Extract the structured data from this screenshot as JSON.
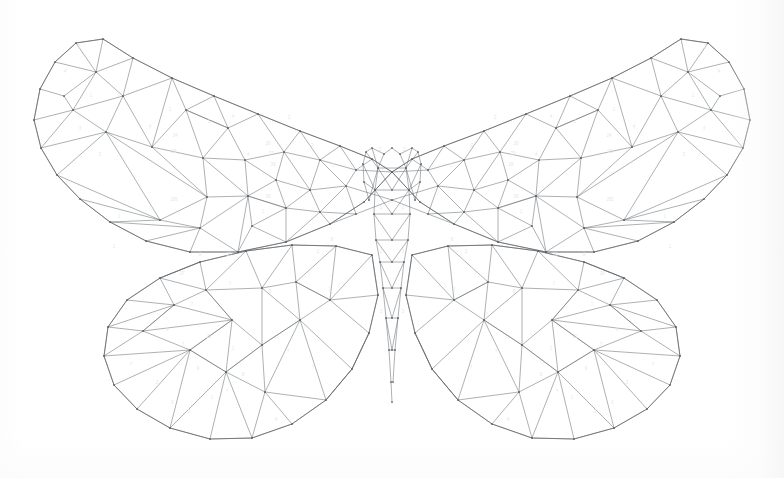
{
  "document": {
    "title": "Color By Number Butterfly",
    "subject": "butterfly",
    "style": "low-poly triangulated color-by-number line art",
    "medium": "line drawing on white paper",
    "symmetry": "bilateral / mirrored about vertical center axis",
    "background_color": "#ffffff",
    "line_color": "#6b6f73",
    "outline_color": "#5c6064",
    "number_color": "#e6e6e6",
    "vertex_dot_color": "#4f5356",
    "canvas": {
      "width": 784,
      "height": 478
    },
    "figure_bounds": {
      "left": 33,
      "top": 31,
      "right": 751,
      "bottom": 441
    },
    "mirror_axis_x": 392
  },
  "legend": {
    "palette_numbers": [
      "1",
      "2",
      "3",
      "4",
      "6",
      "7",
      "8",
      "9",
      "20",
      "22",
      "23",
      "24",
      "26",
      "27",
      "28",
      "29"
    ],
    "note": "Each triangular cell carries a faint palette index numeral."
  },
  "anatomy": {
    "parts": [
      {
        "name": "upper-left-wing",
        "label": "Upper Left Wing"
      },
      {
        "name": "upper-right-wing",
        "label": "Upper Right Wing"
      },
      {
        "name": "lower-left-wing",
        "label": "Lower Left Wing"
      },
      {
        "name": "lower-right-wing",
        "label": "Lower Right Wing"
      },
      {
        "name": "body-thorax",
        "label": "Thorax"
      },
      {
        "name": "body-abdomen",
        "label": "Abdomen"
      },
      {
        "name": "antennae",
        "label": "Antennae"
      }
    ]
  },
  "geometry": {
    "upper_left_wing_outline": "M 392 172 L 372 159 L 340 146 L 300 131 L 258 114 L 214 96 L 172 78 L 133 58 L 103 39 L 76 43 L 55 62 L 40 89 L 34 120 L 41 148 L 57 175 L 80 199 L 110 222 L 146 241 L 190 252 L 238 252 L 286 242 L 330 224 L 364 202 Z",
    "lower_left_wing_outline": "M 372 255 L 336 246 L 292 245 L 246 251 L 200 262 L 160 278 L 127 300 L 108 327 L 104 356 L 114 385 L 137 409 L 170 428 L 210 439 L 252 438 L 292 424 L 326 400 L 352 369 L 369 333 L 378 295 Z",
    "body_outline": "M 392 148 L 384 154 L 378 168 L 375 190 L 374 214 L 376 240 L 380 262 L 383 288 L 386 318 L 389 350 L 391 382 L 392 402",
    "antenna_left": "M 384 154 L 372 148 L 366 152 L 363 164 L 364 182 L 369 200",
    "antenna_right": "M 400 154 L 412 148 L 418 152 L 421 164 L 420 182 L 415 200"
  },
  "edges": {
    "upper_left": [
      "103,39 76,43",
      "76,43 55,62",
      "55,62 40,89",
      "40,89 34,120",
      "34,120 41,148",
      "41,148 57,175",
      "57,175 80,199",
      "80,199 110,222",
      "110,222 146,241",
      "146,241 190,252",
      "190,252 238,252",
      "238,252 286,242",
      "286,242 330,224",
      "330,224 364,202",
      "364,202 392,172",
      "103,39 133,58",
      "133,58 172,78",
      "172,78 214,96",
      "214,96 258,114",
      "258,114 300,131",
      "300,131 340,146",
      "340,146 372,159",
      "372,159 392,172",
      "103,39 96,72",
      "96,72 76,43",
      "96,72 55,62",
      "96,72 64,96",
      "64,96 40,89",
      "96,72 73,110",
      "73,110 64,96",
      "73,110 34,120",
      "73,110 41,148",
      "96,72 133,58",
      "96,72 123,96",
      "123,96 133,58",
      "123,96 172,78",
      "123,96 73,110",
      "123,96 106,132",
      "106,132 73,110",
      "106,132 41,148",
      "106,132 57,175",
      "106,132 152,147",
      "152,147 123,96",
      "152,147 172,78",
      "172,78 186,110",
      "186,110 152,147",
      "186,110 214,96",
      "186,110 228,128",
      "228,128 214,96",
      "228,128 258,114",
      "228,128 186,110",
      "228,128 203,158",
      "203,158 186,110",
      "203,158 152,147",
      "203,158 245,160",
      "245,160 228,128",
      "245,160 284,152",
      "284,152 258,114",
      "284,152 300,131",
      "284,152 320,160",
      "320,160 300,131",
      "320,160 340,146",
      "320,160 356,170",
      "356,170 340,146",
      "356,170 372,159",
      "356,170 392,172",
      "320,160 346,186",
      "346,186 356,170",
      "346,186 392,200",
      "346,186 310,190",
      "310,190 320,160",
      "310,190 284,152",
      "310,190 276,180",
      "276,180 284,152",
      "276,180 245,160",
      "276,180 248,196",
      "248,196 245,160",
      "248,196 203,158",
      "248,196 207,197",
      "207,197 203,158",
      "207,197 152,147",
      "207,197 106,132",
      "207,197 160,220",
      "160,220 106,132",
      "160,220 57,175",
      "160,220 80,199",
      "160,220 110,222",
      "160,220 200,228",
      "200,228 207,197",
      "200,228 248,196",
      "200,228 238,252",
      "200,228 190,252",
      "200,228 146,241",
      "200,228 110,222",
      "248,196 286,208",
      "286,208 276,180",
      "286,208 310,190",
      "286,208 320,212",
      "320,212 310,190",
      "320,212 346,186",
      "320,212 356,214",
      "356,214 346,186",
      "356,214 392,200",
      "356,214 330,224",
      "330,224 320,212",
      "320,212 286,242",
      "286,242 286,208",
      "286,208 248,196",
      "248,196 238,252",
      "286,208 252,226",
      "252,226 248,196",
      "252,226 238,252",
      "252,226 286,242"
    ],
    "lower_left": [
      "372,255 336,246",
      "336,246 292,245",
      "292,245 246,251",
      "246,251 200,262",
      "200,262 160,278",
      "160,278 127,300",
      "127,300 108,327",
      "108,327 104,356",
      "104,356 114,385",
      "114,385 137,409",
      "137,409 170,428",
      "170,428 210,439",
      "210,439 252,438",
      "252,438 292,424",
      "292,424 326,400",
      "326,400 352,369",
      "352,369 369,333",
      "369,333 378,295",
      "378,295 372,255",
      "160,278 174,305",
      "174,305 127,300",
      "174,305 108,327",
      "174,305 143,331",
      "143,331 108,327",
      "143,331 104,356",
      "143,331 174,305",
      "160,278 200,262",
      "160,278 206,290",
      "206,290 200,262",
      "206,290 246,251",
      "206,290 174,305",
      "206,290 232,320",
      "232,320 174,305",
      "232,320 143,331",
      "232,320 206,290",
      "232,320 190,350",
      "190,350 143,331",
      "190,350 104,356",
      "190,350 114,385",
      "190,350 232,320",
      "246,251 262,288",
      "262,288 206,290",
      "262,288 292,245",
      "262,288 296,282",
      "296,282 292,245",
      "296,282 336,246",
      "296,282 330,300",
      "330,300 336,246",
      "330,300 372,255",
      "330,300 378,295",
      "330,300 369,333",
      "330,300 296,282",
      "296,282 300,320",
      "300,320 262,288",
      "300,320 330,300",
      "300,320 352,369",
      "300,320 262,345",
      "262,345 232,320",
      "262,345 262,288",
      "262,345 300,320",
      "262,345 226,372",
      "226,372 190,350",
      "226,372 232,320",
      "226,372 262,345",
      "226,372 265,392",
      "265,392 262,345",
      "265,392 300,320",
      "265,392 326,400",
      "265,392 292,424",
      "265,392 252,438",
      "226,372 210,439",
      "226,372 252,438",
      "226,372 170,428",
      "226,372 190,350",
      "190,350 137,409",
      "190,350 170,428",
      "300,320 326,400",
      "352,369 326,400",
      "369,333 352,369"
    ],
    "body": [
      "392,148 384,154",
      "384,154 378,168",
      "378,168 375,190",
      "375,190 374,214",
      "374,214 376,240",
      "376,240 380,262",
      "380,262 383,288",
      "383,288 386,318",
      "386,318 389,350",
      "389,350 391,382",
      "391,382 392,402",
      "392,148 400,154",
      "400,154 406,168",
      "406,168 409,190",
      "409,190 410,214",
      "410,214 408,240",
      "408,240 404,262",
      "404,262 401,288",
      "401,288 398,318",
      "398,318 395,350",
      "395,350 393,382",
      "378,168 406,168",
      "375,190 409,190",
      "374,214 410,214",
      "376,240 408,240",
      "380,262 404,262",
      "383,288 401,288",
      "386,318 398,318",
      "389,350 395,350",
      "378,168 392,190",
      "392,190 406,168",
      "375,190 392,214",
      "392,214 409,190",
      "374,214 392,240",
      "392,240 410,214",
      "376,240 392,262",
      "392,262 408,240",
      "380,262 392,288",
      "392,288 404,262",
      "383,288 392,318",
      "392,318 401,288",
      "386,318 392,350",
      "392,350 398,318"
    ],
    "antennae": [
      "384,154 372,148",
      "372,148 366,152",
      "366,152 363,164",
      "363,164 364,182",
      "364,182 369,200",
      "369,200 378,168",
      "372,148 378,168",
      "366,152 378,168",
      "363,164 375,190",
      "364,182 375,190",
      "400,154 412,148",
      "412,148 418,152",
      "418,152 421,164",
      "421,164 420,182",
      "420,182 415,200",
      "415,200 406,168",
      "412,148 406,168",
      "418,152 406,168",
      "421,164 409,190",
      "420,182 409,190"
    ]
  },
  "cells": [
    {
      "number": "2",
      "x": 79,
      "y": 47
    },
    {
      "number": "4",
      "x": 65,
      "y": 72
    },
    {
      "number": "1",
      "x": 91,
      "y": 96
    },
    {
      "number": "2",
      "x": 119,
      "y": 96
    },
    {
      "number": "3",
      "x": 80,
      "y": 129
    },
    {
      "number": "4",
      "x": 150,
      "y": 127
    },
    {
      "number": "2",
      "x": 100,
      "y": 155
    },
    {
      "number": "1",
      "x": 119,
      "y": 217
    },
    {
      "number": "1",
      "x": 114,
      "y": 247
    },
    {
      "number": "1",
      "x": 170,
      "y": 110
    },
    {
      "number": "2",
      "x": 172,
      "y": 200
    },
    {
      "number": "24",
      "x": 175,
      "y": 136
    },
    {
      "number": "26",
      "x": 174,
      "y": 152
    },
    {
      "number": "26",
      "x": 175,
      "y": 200
    },
    {
      "number": "1",
      "x": 209,
      "y": 122
    },
    {
      "number": "4",
      "x": 233,
      "y": 117
    },
    {
      "number": "2",
      "x": 289,
      "y": 118
    },
    {
      "number": "26",
      "x": 268,
      "y": 144
    },
    {
      "number": "27",
      "x": 271,
      "y": 154
    },
    {
      "number": "28",
      "x": 273,
      "y": 165
    },
    {
      "number": "4",
      "x": 248,
      "y": 155
    },
    {
      "number": "2",
      "x": 312,
      "y": 146
    },
    {
      "number": "1",
      "x": 333,
      "y": 166
    },
    {
      "number": "26",
      "x": 268,
      "y": 197
    },
    {
      "number": "1",
      "x": 263,
      "y": 212
    },
    {
      "number": "8",
      "x": 332,
      "y": 240
    },
    {
      "number": "2",
      "x": 318,
      "y": 252
    },
    {
      "number": "6",
      "x": 270,
      "y": 292
    },
    {
      "number": "8",
      "x": 200,
      "y": 255
    },
    {
      "number": "23",
      "x": 229,
      "y": 255
    },
    {
      "number": "27",
      "x": 182,
      "y": 274
    },
    {
      "number": "7",
      "x": 230,
      "y": 284
    },
    {
      "number": "7",
      "x": 192,
      "y": 305
    },
    {
      "number": "9",
      "x": 167,
      "y": 330
    },
    {
      "number": "7",
      "x": 183,
      "y": 345
    },
    {
      "number": "22",
      "x": 209,
      "y": 337
    },
    {
      "number": "7",
      "x": 131,
      "y": 365
    },
    {
      "number": "2",
      "x": 157,
      "y": 383
    },
    {
      "number": "3",
      "x": 172,
      "y": 403
    },
    {
      "number": "2",
      "x": 189,
      "y": 412
    },
    {
      "number": "9",
      "x": 198,
      "y": 369
    },
    {
      "number": "1",
      "x": 212,
      "y": 398
    },
    {
      "number": "7",
      "x": 227,
      "y": 392
    },
    {
      "number": "8",
      "x": 243,
      "y": 375
    },
    {
      "number": "1",
      "x": 233,
      "y": 349
    },
    {
      "number": "7",
      "x": 298,
      "y": 315
    },
    {
      "number": "7",
      "x": 288,
      "y": 352
    },
    {
      "number": "7",
      "x": 313,
      "y": 368
    },
    {
      "number": "4",
      "x": 276,
      "y": 420
    },
    {
      "number": "2",
      "x": 330,
      "y": 290
    },
    {
      "number": "2",
      "x": 380,
      "y": 150
    },
    {
      "number": "2",
      "x": 404,
      "y": 150
    },
    {
      "number": "1",
      "x": 381,
      "y": 208
    },
    {
      "number": "1",
      "x": 403,
      "y": 208
    },
    {
      "number": "2",
      "x": 381,
      "y": 252
    },
    {
      "number": "2",
      "x": 403,
      "y": 252
    },
    {
      "number": "2",
      "x": 381,
      "y": 312
    },
    {
      "number": "2",
      "x": 403,
      "y": 312
    },
    {
      "number": "2",
      "x": 705,
      "y": 47
    },
    {
      "number": "4",
      "x": 719,
      "y": 72
    },
    {
      "number": "1",
      "x": 693,
      "y": 96
    },
    {
      "number": "2",
      "x": 665,
      "y": 96
    },
    {
      "number": "3",
      "x": 704,
      "y": 129
    },
    {
      "number": "4",
      "x": 634,
      "y": 127
    },
    {
      "number": "2",
      "x": 684,
      "y": 155
    },
    {
      "number": "1",
      "x": 665,
      "y": 217
    },
    {
      "number": "1",
      "x": 670,
      "y": 247
    },
    {
      "number": "1",
      "x": 614,
      "y": 110
    },
    {
      "number": "2",
      "x": 612,
      "y": 200
    },
    {
      "number": "24",
      "x": 609,
      "y": 136
    },
    {
      "number": "26",
      "x": 610,
      "y": 152
    },
    {
      "number": "26",
      "x": 609,
      "y": 200
    },
    {
      "number": "1",
      "x": 575,
      "y": 122
    },
    {
      "number": "4",
      "x": 551,
      "y": 117
    },
    {
      "number": "2",
      "x": 495,
      "y": 118
    },
    {
      "number": "26",
      "x": 516,
      "y": 144
    },
    {
      "number": "29",
      "x": 513,
      "y": 154
    },
    {
      "number": "28",
      "x": 511,
      "y": 165
    },
    {
      "number": "4",
      "x": 536,
      "y": 155
    },
    {
      "number": "2",
      "x": 472,
      "y": 146
    },
    {
      "number": "1",
      "x": 451,
      "y": 166
    },
    {
      "number": "26",
      "x": 516,
      "y": 197
    },
    {
      "number": "1",
      "x": 521,
      "y": 212
    },
    {
      "number": "8",
      "x": 452,
      "y": 240
    },
    {
      "number": "2",
      "x": 466,
      "y": 252
    },
    {
      "number": "6",
      "x": 514,
      "y": 292
    },
    {
      "number": "8",
      "x": 584,
      "y": 255
    },
    {
      "number": "23",
      "x": 555,
      "y": 255
    },
    {
      "number": "29",
      "x": 602,
      "y": 274
    },
    {
      "number": "7",
      "x": 554,
      "y": 284
    },
    {
      "number": "7",
      "x": 592,
      "y": 305
    },
    {
      "number": "9",
      "x": 617,
      "y": 330
    },
    {
      "number": "7",
      "x": 601,
      "y": 345
    },
    {
      "number": "22",
      "x": 575,
      "y": 337
    },
    {
      "number": "7",
      "x": 653,
      "y": 365
    },
    {
      "number": "2",
      "x": 627,
      "y": 383
    },
    {
      "number": "3",
      "x": 612,
      "y": 403
    },
    {
      "number": "2",
      "x": 595,
      "y": 412
    },
    {
      "number": "9",
      "x": 586,
      "y": 369
    },
    {
      "number": "1",
      "x": 572,
      "y": 398
    },
    {
      "number": "7",
      "x": 557,
      "y": 392
    },
    {
      "number": "8",
      "x": 541,
      "y": 375
    },
    {
      "number": "1",
      "x": 551,
      "y": 349
    },
    {
      "number": "7",
      "x": 486,
      "y": 315
    },
    {
      "number": "7",
      "x": 496,
      "y": 352
    },
    {
      "number": "7",
      "x": 471,
      "y": 368
    },
    {
      "number": "4",
      "x": 508,
      "y": 420
    },
    {
      "number": "2",
      "x": 454,
      "y": 290
    }
  ]
}
